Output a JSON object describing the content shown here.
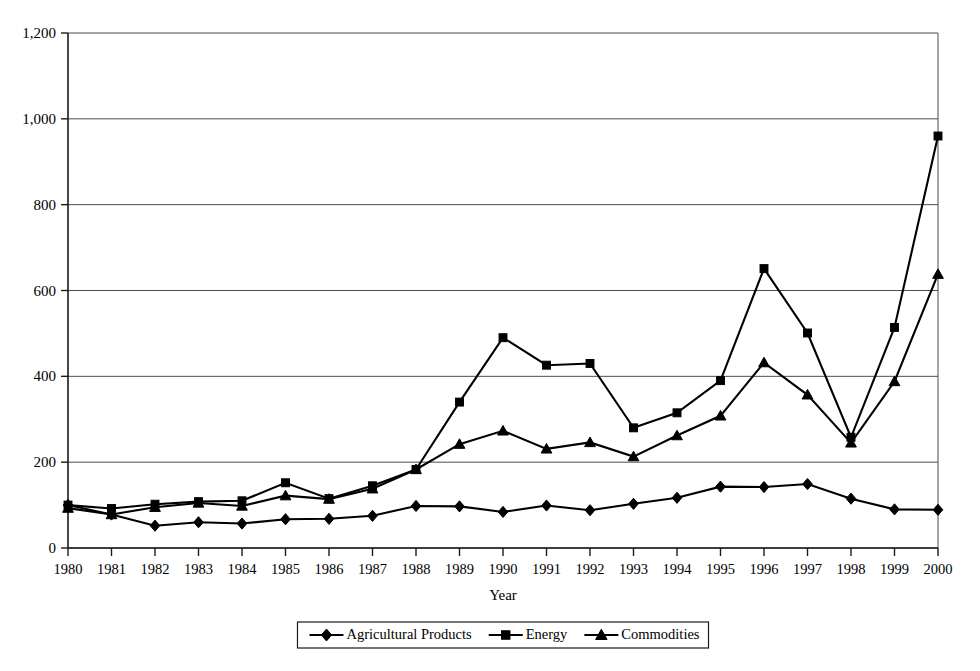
{
  "chart_data": {
    "type": "line",
    "title": "",
    "xlabel": "Year",
    "ylabel": "",
    "grid": true,
    "legend_position": "bottom",
    "xlim": [
      1980,
      2000
    ],
    "ylim": [
      0,
      1200
    ],
    "ytick_labels": [
      "0",
      "200",
      "400",
      "600",
      "800",
      "1,000",
      "1,200"
    ],
    "ytick_values": [
      0,
      200,
      400,
      600,
      800,
      1000,
      1200
    ],
    "categories": [
      1980,
      1981,
      1982,
      1983,
      1984,
      1985,
      1986,
      1987,
      1988,
      1989,
      1990,
      1991,
      1992,
      1993,
      1994,
      1995,
      1996,
      1997,
      1998,
      1999,
      2000
    ],
    "xtick_labels": [
      "1980",
      "1981",
      "1982",
      "1983",
      "1984",
      "1985",
      "1986",
      "1987",
      "1988",
      "1989",
      "1990",
      "1991",
      "1992",
      "1993",
      "1994",
      "1995",
      "1996",
      "1997",
      "1998",
      "1999",
      "2000"
    ],
    "series": [
      {
        "name": "Agricultural Products",
        "marker": "diamond",
        "color": "#000000",
        "values": [
          100,
          78,
          52,
          60,
          57,
          67,
          68,
          75,
          98,
          97,
          84,
          99,
          88,
          103,
          117,
          143,
          142,
          149,
          115,
          90,
          89
        ]
      },
      {
        "name": "Energy",
        "marker": "square",
        "color": "#000000",
        "values": [
          100,
          92,
          102,
          108,
          110,
          152,
          115,
          145,
          183,
          340,
          490,
          426,
          430,
          280,
          315,
          390,
          651,
          501,
          258,
          514,
          960
        ]
      },
      {
        "name": "Commodities",
        "marker": "triangle",
        "color": "#000000",
        "values": [
          93,
          78,
          95,
          105,
          98,
          122,
          114,
          138,
          183,
          242,
          273,
          231,
          246,
          213,
          262,
          308,
          432,
          357,
          245,
          388,
          638
        ]
      }
    ]
  },
  "legend": {
    "entries": [
      {
        "label": "Agricultural Products",
        "marker": "diamond"
      },
      {
        "label": "Energy",
        "marker": "square"
      },
      {
        "label": "Commodities",
        "marker": "triangle"
      }
    ]
  },
  "axis": {
    "x_title": "Year"
  }
}
